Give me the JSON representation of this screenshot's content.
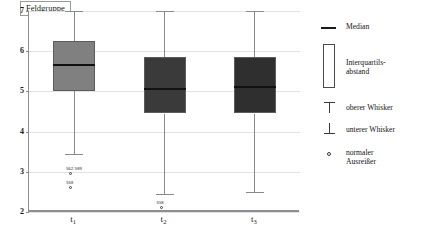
{
  "chart_data": {
    "type": "box",
    "title": "Feldgruppe",
    "xlabel": "",
    "ylabel": "",
    "ylim": [
      2,
      7
    ],
    "yticks": [
      7,
      6,
      5,
      4,
      3,
      2
    ],
    "grid": true,
    "categories": [
      "t₁",
      "t₂",
      "t₃"
    ],
    "legend_position": "right",
    "boxes": [
      {
        "category": "t₁",
        "whisker_high": 7.0,
        "q3": 6.25,
        "median": 5.65,
        "q1": 5.0,
        "whisker_low": 3.45,
        "fill": "#808080",
        "outliers": [
          {
            "value": 2.95,
            "labels": "562  589"
          },
          {
            "value": 2.6,
            "labels": "558"
          }
        ]
      },
      {
        "category": "t₂",
        "whisker_high": 7.0,
        "q3": 5.85,
        "median": 5.05,
        "q1": 4.45,
        "whisker_low": 2.45,
        "fill": "#3a3a3a",
        "outliers": [
          {
            "value": 2.1,
            "labels": "558"
          }
        ]
      },
      {
        "category": "t₃",
        "whisker_high": 7.0,
        "q3": 5.85,
        "median": 5.1,
        "q1": 4.45,
        "whisker_low": 2.5,
        "fill": "#2f2f2f",
        "outliers": []
      }
    ],
    "legend": [
      {
        "symbol": "median-line",
        "label": "Median"
      },
      {
        "symbol": "iqr-box",
        "label": "Interquartils-\nabstand"
      },
      {
        "symbol": "upper-whisker",
        "label": "oberer Whisker"
      },
      {
        "symbol": "lower-whisker",
        "label": "unterer Whisker"
      },
      {
        "symbol": "outlier-circle",
        "label": "normaler\nAusreißer"
      }
    ]
  },
  "axis": {
    "ytick_0": "7",
    "ytick_1": "6",
    "ytick_2": "5",
    "ytick_3": "4",
    "ytick_4": "3",
    "ytick_5": "2"
  },
  "colors": {
    "grid": "#e2e2e2",
    "axis": "#8d8d8d",
    "median": "#111111",
    "box_light": "#808080",
    "box_dark": "#3a3a3a"
  }
}
